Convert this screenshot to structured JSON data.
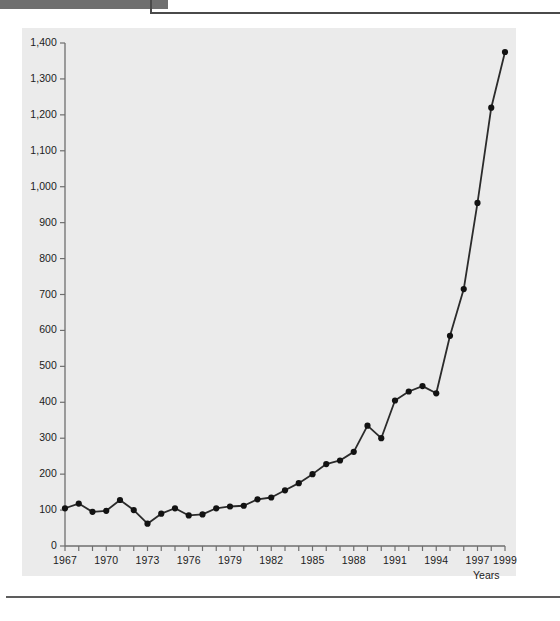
{
  "chart_data": {
    "type": "line",
    "title": "",
    "xlabel": "Years",
    "ylabel": "",
    "xlim": [
      1967,
      1999
    ],
    "ylim": [
      0,
      1400
    ],
    "grid": false,
    "legend": "none",
    "y_ticks": [
      0,
      100,
      200,
      300,
      400,
      500,
      600,
      700,
      800,
      900,
      1000,
      1100,
      1200,
      1300,
      1400
    ],
    "y_tick_labels": [
      "0",
      "100",
      "200",
      "300",
      "400",
      "500",
      "600",
      "700",
      "800",
      "900",
      "1,000",
      "1,100",
      "1,200",
      "1,300",
      "1,400"
    ],
    "x_ticks": [
      1967,
      1968,
      1969,
      1970,
      1971,
      1972,
      1973,
      1974,
      1975,
      1976,
      1977,
      1978,
      1979,
      1980,
      1981,
      1982,
      1983,
      1984,
      1985,
      1986,
      1987,
      1988,
      1989,
      1990,
      1991,
      1992,
      1993,
      1994,
      1995,
      1996,
      1997,
      1998,
      1999
    ],
    "x_tick_labels": [
      "1967",
      "1970",
      "1973",
      "1976",
      "1979",
      "1982",
      "1985",
      "1988",
      "1991",
      "1994",
      "1997",
      "1999"
    ],
    "x_labelled_ticks": [
      1967,
      1970,
      1973,
      1976,
      1979,
      1982,
      1985,
      1988,
      1991,
      1994,
      1997,
      1999
    ],
    "x": [
      1967,
      1968,
      1969,
      1970,
      1971,
      1972,
      1973,
      1974,
      1975,
      1976,
      1977,
      1978,
      1979,
      1980,
      1981,
      1982,
      1983,
      1984,
      1985,
      1986,
      1987,
      1988,
      1989,
      1990,
      1991,
      1992,
      1993,
      1994,
      1995,
      1996,
      1997,
      1998,
      1999
    ],
    "values": [
      105,
      118,
      95,
      98,
      128,
      100,
      62,
      90,
      105,
      85,
      88,
      105,
      110,
      112,
      130,
      135,
      155,
      175,
      200,
      228,
      238,
      262,
      335,
      300,
      405,
      430,
      445,
      425,
      585,
      715,
      955,
      1220,
      1375
    ],
    "marker": "filled-circle",
    "line_color": "#2b2b2b",
    "marker_color": "#121212",
    "plot_background": "#ebebeb"
  },
  "figure": {
    "axis_color": "#6e6e6e"
  }
}
